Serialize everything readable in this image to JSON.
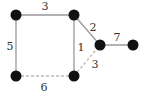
{
  "graph": {
    "colors": {
      "node": "#111111",
      "edge_solid": "#999999",
      "edge_dashed": "#bbbbbb",
      "label": "#333333"
    },
    "nodes": [
      {
        "id": "A",
        "x": 16,
        "y": 15
      },
      {
        "id": "B",
        "x": 74,
        "y": 15
      },
      {
        "id": "C",
        "x": 100,
        "y": 45
      },
      {
        "id": "D",
        "x": 133,
        "y": 45
      },
      {
        "id": "E",
        "x": 16,
        "y": 76
      },
      {
        "id": "F",
        "x": 74,
        "y": 76
      }
    ],
    "edges": [
      {
        "from": "A",
        "to": "B",
        "weight": "3",
        "style": "solid",
        "label_x": 45,
        "label_y": 10
      },
      {
        "from": "A",
        "to": "E",
        "weight": "5",
        "style": "solid",
        "label_x": 10,
        "label_y": 50
      },
      {
        "from": "B",
        "to": "F",
        "weight": "1",
        "style": "solid",
        "label_x": 81,
        "label_y": 51
      },
      {
        "from": "B",
        "to": "C",
        "weight": "2",
        "style": "solid",
        "label_x": 93,
        "label_y": 31
      },
      {
        "from": "C",
        "to": "D",
        "weight": "7",
        "style": "solid",
        "label_x": 117,
        "label_y": 41
      },
      {
        "from": "E",
        "to": "F",
        "weight": "6",
        "style": "dashed",
        "label_x": 44,
        "label_y": 91
      },
      {
        "from": "F",
        "to": "C",
        "weight": "3",
        "style": "dashed",
        "label_x": 95,
        "label_y": 68
      }
    ]
  }
}
